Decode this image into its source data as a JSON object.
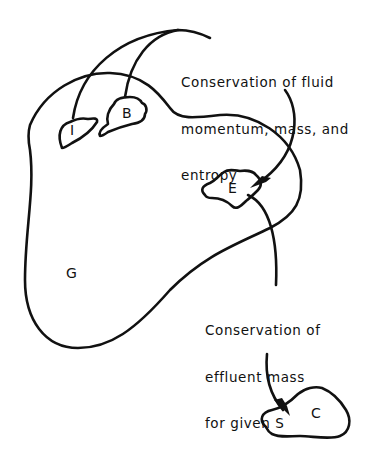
{
  "diagram": {
    "regions": {
      "G": {
        "label": "G"
      },
      "I": {
        "label": "I"
      },
      "B": {
        "label": "B"
      },
      "E": {
        "label": "E"
      },
      "C": {
        "label": "C"
      }
    },
    "annotations": {
      "fluid": {
        "line1": "Conservation of fluid",
        "line2": "momentum, mass, and",
        "line3": "entropy"
      },
      "effluent": {
        "line1": "Conservation of",
        "line2": "effluent mass",
        "line3": "for given S"
      }
    },
    "arrows": [
      {
        "from": [
          "I",
          "B"
        ],
        "to": "E",
        "label_ref": "fluid"
      },
      {
        "from": "E",
        "to": "C",
        "label_ref": "effluent"
      }
    ],
    "colors": {
      "stroke": "#111111",
      "background": "#ffffff"
    }
  }
}
